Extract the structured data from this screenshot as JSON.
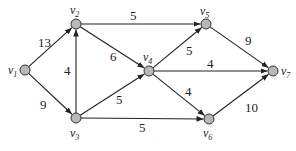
{
  "nodes": [
    {
      "id": "v1",
      "label": "v",
      "sub": "1",
      "x": 25,
      "y": 70,
      "lx": 8,
      "ly": 74
    },
    {
      "id": "v2",
      "label": "v",
      "sub": "2",
      "x": 76,
      "y": 24,
      "lx": 70,
      "ly": 14
    },
    {
      "id": "v3",
      "label": "v",
      "sub": "3",
      "x": 76,
      "y": 118,
      "lx": 70,
      "ly": 137
    },
    {
      "id": "v4",
      "label": "v",
      "sub": "4",
      "x": 149,
      "y": 71,
      "lx": 143,
      "ly": 61
    },
    {
      "id": "v5",
      "label": "v",
      "sub": "5",
      "x": 206,
      "y": 24,
      "lx": 200,
      "ly": 15
    },
    {
      "id": "v6",
      "label": "v",
      "sub": "6",
      "x": 209,
      "y": 119,
      "lx": 203,
      "ly": 137
    },
    {
      "id": "v7",
      "label": "v",
      "sub": "7",
      "x": 273,
      "y": 71,
      "lx": 281,
      "ly": 75
    }
  ],
  "edges": [
    {
      "from": "v1",
      "to": "v2",
      "weight": "13",
      "lx": 38,
      "ly": 47
    },
    {
      "from": "v1",
      "to": "v3",
      "weight": "9",
      "lx": 40,
      "ly": 109
    },
    {
      "from": "v3",
      "to": "v2",
      "weight": "4",
      "lx": 64,
      "ly": 75
    },
    {
      "from": "v2",
      "to": "v5",
      "weight": "5",
      "lx": 130,
      "ly": 20
    },
    {
      "from": "v2",
      "to": "v4",
      "weight": "6",
      "lx": 110,
      "ly": 61
    },
    {
      "from": "v3",
      "to": "v4",
      "weight": "5",
      "lx": 116,
      "ly": 104
    },
    {
      "from": "v3",
      "to": "v6",
      "weight": "5",
      "lx": 139,
      "ly": 132
    },
    {
      "from": "v4",
      "to": "v5",
      "weight": "5",
      "lx": 186,
      "ly": 55
    },
    {
      "from": "v4",
      "to": "v7",
      "weight": "4",
      "lx": 207,
      "ly": 68
    },
    {
      "from": "v4",
      "to": "v6",
      "weight": "4",
      "lx": 185,
      "ly": 96
    },
    {
      "from": "v5",
      "to": "v7",
      "weight": "9",
      "lx": 245,
      "ly": 45
    },
    {
      "from": "v6",
      "to": "v7",
      "weight": "10",
      "lx": 245,
      "ly": 112
    }
  ]
}
